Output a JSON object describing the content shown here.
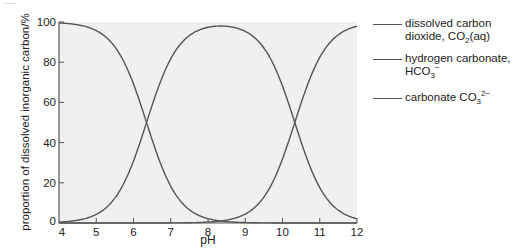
{
  "chart_data": {
    "type": "line",
    "title": "",
    "xlabel": "pH",
    "ylabel": "proportion of dissolved inorganic carbon/%",
    "xlim": [
      4,
      12
    ],
    "ylim": [
      0,
      100
    ],
    "x_ticks": [
      4,
      5,
      6,
      7,
      8,
      9,
      10,
      11,
      12
    ],
    "y_ticks": [
      0,
      20,
      40,
      60,
      80,
      100
    ],
    "grid": false,
    "plot_background": "#f0f0f0",
    "line_color": "#555555",
    "legend_position": "right",
    "x": [
      4,
      4.5,
      5,
      5.5,
      6,
      6.35,
      6.5,
      7,
      7.5,
      8,
      8.34,
      8.5,
      9,
      9.5,
      10,
      10.33,
      10.5,
      11,
      11.5,
      12
    ],
    "series": [
      {
        "name": "dissolved carbon dioxide, CO2(aq)",
        "values": [
          99.6,
          98.6,
          95.7,
          87.6,
          69.1,
          50.0,
          41.4,
          18.3,
          6.6,
          2.2,
          1.0,
          0.7,
          0.2,
          0.1,
          0.0,
          0.0,
          0.0,
          0.0,
          0.0,
          0.0
        ]
      },
      {
        "name": "hydrogen carbonate, HCO3−",
        "values": [
          0.4,
          1.4,
          4.3,
          12.4,
          30.9,
          50.0,
          58.5,
          81.6,
          93.2,
          97.3,
          98.0,
          97.8,
          92.9,
          80.4,
          68.1,
          50.0,
          40.3,
          17.6,
          6.3,
          2.1
        ]
      },
      {
        "name": "carbonate CO3 2−",
        "values": [
          0.0,
          0.0,
          0.0,
          0.0,
          0.0,
          0.0,
          0.0,
          0.1,
          0.2,
          0.5,
          1.0,
          1.5,
          6.9,
          19.5,
          31.9,
          50.0,
          59.7,
          82.4,
          93.7,
          97.9
        ]
      }
    ],
    "pKa": [
      6.35,
      10.33
    ]
  },
  "axis": {
    "xlabel": "pH",
    "ylabel": "proportion of dissolved inorganic carbon/%",
    "x_tick_labels": [
      "4",
      "5",
      "6",
      "7",
      "8",
      "9",
      "10",
      "11",
      "12"
    ],
    "y_tick_labels": [
      "0",
      "20",
      "40",
      "60",
      "80",
      "100"
    ]
  },
  "legend": {
    "items": [
      {
        "line1": "dissolved carbon",
        "line2_pre": "dioxide, CO",
        "line2_sub": "2",
        "line2_post": "(aq)"
      },
      {
        "line1": "hydrogen carbonate,",
        "line2_pre": "HCO",
        "line2_sub": "3",
        "line2_sup": "−"
      },
      {
        "line1_pre": "carbonate CO",
        "line1_sub": "3",
        "line1_sup": "2−"
      }
    ]
  }
}
